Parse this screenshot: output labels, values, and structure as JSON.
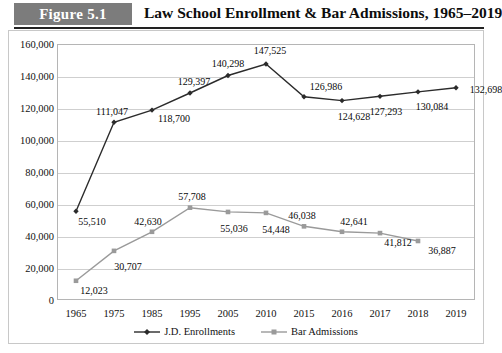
{
  "header": {
    "badge": "Figure 5.1",
    "title": "Law School Enrollment & Bar Admissions, 1965–2019"
  },
  "colors": {
    "badge_background": "#7c7c7c",
    "jd_series": "#2b2b2b",
    "bar_series": "#9a9a9a",
    "gridline": "#cfcfcf",
    "plot_border": "#b5b5b5"
  },
  "legend": [
    {
      "label": "J.D. Enrollments",
      "marker": "diamond-marker",
      "color": "#2b2b2b"
    },
    {
      "label": "Bar Admissions",
      "marker": "square-marker",
      "color": "#9a9a9a"
    }
  ],
  "chart_data": {
    "type": "line",
    "title": "Law School Enrollment & Bar Admissions, 1965–2019",
    "xlabel": "",
    "ylabel": "",
    "ylim": [
      0,
      160000
    ],
    "ytick_step": 20000,
    "grid": true,
    "legend_position": "bottom",
    "categories": [
      "1965",
      "1975",
      "1985",
      "1995",
      "2005",
      "2010",
      "2015",
      "2016",
      "2017",
      "2018",
      "2019"
    ],
    "ytick_labels": [
      "0",
      "20,000",
      "40,000",
      "60,000",
      "80,000",
      "100,000",
      "120,000",
      "140,000",
      "160,000"
    ],
    "series": [
      {
        "name": "J.D. Enrollments",
        "color": "#2b2b2b",
        "marker": "diamond",
        "values": [
          55510,
          111047,
          118700,
          129397,
          140298,
          147525,
          126986,
          124628,
          127293,
          130084,
          132698
        ],
        "labels": [
          "55,510",
          "111,047",
          "118,700",
          "129,397",
          "140,298",
          "147,525",
          "126,986",
          "124,628",
          "127,293",
          "130,084",
          "132,698"
        ]
      },
      {
        "name": "Bar Admissions",
        "color": "#9a9a9a",
        "marker": "square",
        "values": [
          12023,
          30707,
          42630,
          57708,
          55036,
          54448,
          46038,
          42641,
          41812,
          36887,
          null
        ],
        "labels": [
          "12,023",
          "30,707",
          "42,630",
          "57,708",
          "55,036",
          "54,448",
          "46,038",
          "42,641",
          "41,812",
          "36,887",
          null
        ]
      }
    ]
  }
}
